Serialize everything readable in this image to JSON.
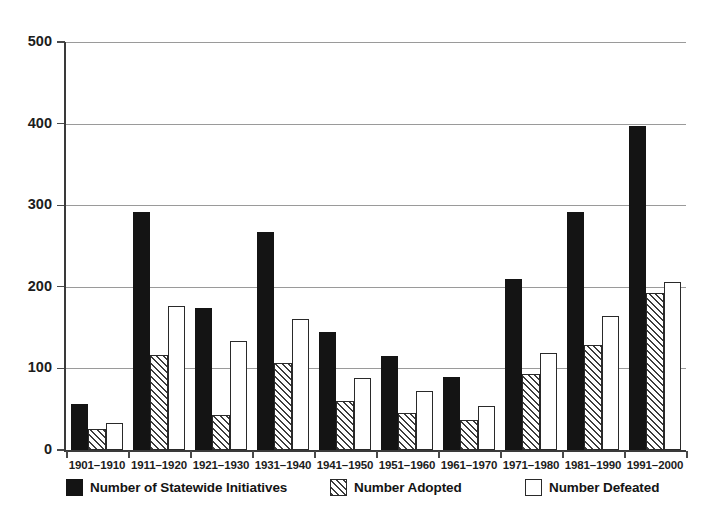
{
  "chart_data": {
    "type": "bar",
    "title": "",
    "subtitle": "",
    "xlabel": "",
    "ylabel": "",
    "ylim": [
      0,
      500
    ],
    "yticks": [
      0,
      100,
      200,
      300,
      400,
      500
    ],
    "ytick_labels": [
      "0",
      "100",
      "200",
      "300",
      "400",
      "500"
    ],
    "grid": "horizontal",
    "legend_position": "bottom",
    "categories": [
      "1901–1910",
      "1911–1920",
      "1921–1930",
      "1931–1940",
      "1941–1950",
      "1951–1960",
      "1961–1970",
      "1971–1980",
      "1981–1990",
      "1991–2000"
    ],
    "series": [
      {
        "name": "Number of Statewide Initiatives",
        "style": "solid-black",
        "color": "#141414",
        "values": [
          56,
          292,
          174,
          267,
          145,
          115,
          90,
          210,
          292,
          397
        ]
      },
      {
        "name": "Number Adopted",
        "style": "hatched",
        "color": "#3d3d3d",
        "values": [
          26,
          116,
          43,
          107,
          60,
          45,
          37,
          93,
          129,
          193
        ]
      },
      {
        "name": "Number Defeated",
        "style": "white-outline",
        "color": "#ffffff",
        "values": [
          33,
          177,
          133,
          161,
          88,
          72,
          54,
          119,
          164,
          206
        ]
      }
    ]
  },
  "legend": {
    "items": [
      {
        "label": "Number of Statewide Initiatives",
        "swatch": "solid-black-swatch"
      },
      {
        "label": "Number Adopted",
        "swatch": "hatched-swatch"
      },
      {
        "label": "Number Defeated",
        "swatch": "white-outline-swatch"
      }
    ]
  }
}
